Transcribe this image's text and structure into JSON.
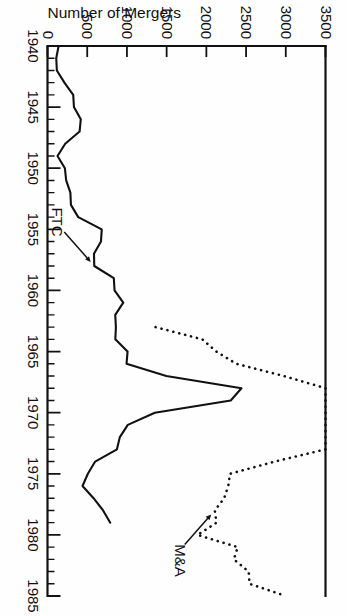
{
  "chart_data": {
    "type": "line",
    "title": "",
    "xlabel": "",
    "ylabel": "Number of Mergers",
    "xlim": [
      1940,
      1985
    ],
    "ylim": [
      0,
      3500
    ],
    "xticks": [
      "1940",
      "1945",
      "1950",
      "1955",
      "1960",
      "1965",
      "1970",
      "1975",
      "1980",
      "1985"
    ],
    "yticks": [
      "0",
      "500",
      "1000",
      "1500",
      "2000",
      "2500",
      "3000",
      "3500"
    ],
    "xtick_step": 5,
    "xtick_minor_step": 1,
    "ytick_step": 500,
    "grid": false,
    "legend_position": "inline-annotations",
    "orientation": "rotated-90-ccw",
    "series": [
      {
        "name": "FTC",
        "style": "solid",
        "label": "FTC",
        "x": [
          1940,
          1941,
          1942,
          1943,
          1944,
          1945,
          1946,
          1947,
          1948,
          1949,
          1950,
          1951,
          1952,
          1953,
          1954,
          1955,
          1956,
          1957,
          1958,
          1959,
          1960,
          1961,
          1962,
          1963,
          1964,
          1965,
          1966,
          1967,
          1968,
          1969,
          1970,
          1971,
          1972,
          1973,
          1974,
          1975,
          1976,
          1977,
          1978,
          1979
        ],
        "values": [
          140,
          110,
          118,
          213,
          324,
          333,
          419,
          404,
          223,
          126,
          219,
          235,
          288,
          295,
          387,
          683,
          673,
          585,
          589,
          835,
          844,
          954,
          853,
          861,
          854,
          1008,
          995,
          1496,
          2442,
          2307,
          1351,
          1011,
          911,
          874,
          600,
          508,
          441,
          580,
          700,
          790
        ]
      },
      {
        "name": "M&A",
        "style": "dotted",
        "label": "M&A",
        "x": [
          1963,
          1964,
          1965,
          1966,
          1967,
          1968,
          1969,
          1970,
          1971,
          1972,
          1973,
          1974,
          1975,
          1976,
          1977,
          1978,
          1979,
          1980,
          1981,
          1982,
          1983,
          1984,
          1985
        ],
        "values": [
          1361,
          1950,
          2125,
          2377,
          2975,
          4462,
          6107,
          5152,
          4608,
          4801,
          4040,
          2861,
          2297,
          2276,
          2224,
          2106,
          2128,
          1889,
          2395,
          2346,
          2533,
          2543,
          3001
        ]
      }
    ],
    "annotations": [
      {
        "text": "FTC",
        "points_to_series": "FTC",
        "at_x": 1958,
        "at_y": 589
      },
      {
        "text": "M&A",
        "points_to_series": "M&A",
        "at_x": 1978,
        "at_y": 2106
      }
    ]
  }
}
